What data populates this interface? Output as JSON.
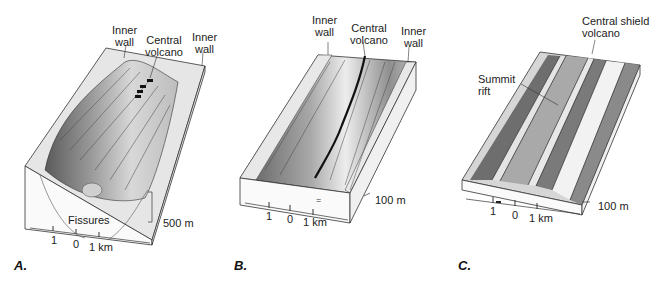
{
  "figure": {
    "panels": [
      {
        "id": "A",
        "panel_label": "A.",
        "annotations": {
          "inner_wall_left_line1": "Inner",
          "inner_wall_left_line2": "wall",
          "central_volcano_line1": "Central",
          "central_volcano_line2": "volcano",
          "inner_wall_right_line1": "Inner",
          "inner_wall_right_line2": "wall",
          "fissures": "Fissures"
        },
        "scale": {
          "horizontal_ticks": [
            "1",
            "0",
            "1 km"
          ],
          "vertical": "500 m"
        }
      },
      {
        "id": "B",
        "panel_label": "B.",
        "annotations": {
          "inner_wall_left_line1": "Inner",
          "inner_wall_left_line2": "wall",
          "central_volcano_line1": "Central",
          "central_volcano_line2": "volcano",
          "inner_wall_right_line1": "Inner",
          "inner_wall_right_line2": "wall"
        },
        "scale": {
          "horizontal_ticks": [
            "1",
            "0",
            "1 km"
          ],
          "vertical": "100 m"
        }
      },
      {
        "id": "C",
        "panel_label": "C.",
        "annotations": {
          "central_shield_line1": "Central shield",
          "central_shield_line2": "volcano",
          "summit_rift_line1": "Summit",
          "summit_rift_line2": "rift"
        },
        "scale": {
          "horizontal_ticks": [
            "1",
            "0",
            "1 km"
          ],
          "vertical": "100 m"
        }
      }
    ]
  }
}
